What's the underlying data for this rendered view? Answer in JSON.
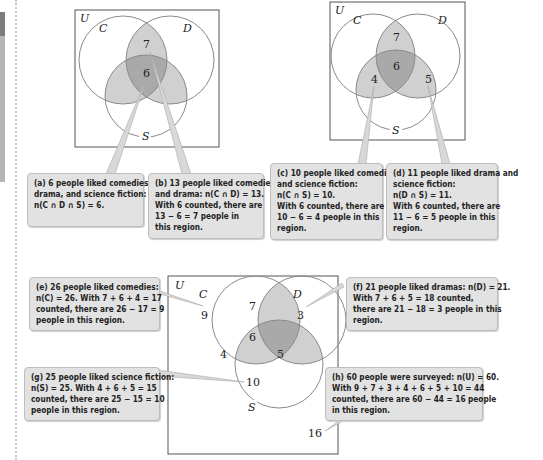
{
  "colors": {
    "light_region": "#d0d0d0",
    "dark_region": "#a9a9a9",
    "circle_stroke": "#8a8a8a",
    "callout_bg": "#e2e2e2"
  },
  "diagrams": [
    {
      "id": "top-left",
      "labels": {
        "universe": "U",
        "c": "C",
        "d": "D",
        "s": "S"
      },
      "regions": {
        "cd_only": "7",
        "cds": "6"
      }
    },
    {
      "id": "top-right",
      "labels": {
        "universe": "U",
        "c": "C",
        "d": "D",
        "s": "S"
      },
      "regions": {
        "cd_only": "7",
        "cds": "6",
        "cs_only": "4",
        "ds_only": "5"
      }
    },
    {
      "id": "bottom",
      "labels": {
        "universe": "U",
        "c": "C",
        "d": "D",
        "s": "S"
      },
      "regions": {
        "c_only": "9",
        "d_only": "3",
        "cd_only": "7",
        "cds": "6",
        "cs_only": "4",
        "ds_only": "5",
        "s_only": "10",
        "outside": "16"
      }
    }
  ],
  "callouts": {
    "a": [
      "(a) 6 people liked comedies,",
      "drama, and science fiction:",
      "n(C ∩ D ∩ S) = 6."
    ],
    "b": [
      "(b) 13 people liked comedies",
      "and drama: n(C ∩ D) = 13.",
      "With 6 counted, there are",
      "13 − 6 = 7 people in",
      "this region."
    ],
    "c": [
      "(c) 10 people liked comedies",
      "and science fiction:",
      "n(C ∩ S) = 10.",
      "With 6 counted, there are",
      "10 − 6 = 4 people in this",
      "region."
    ],
    "d": [
      "(d) 11 people liked drama and",
      "science fiction:",
      "n(D ∩ S) = 11.",
      "With 6 counted, there are",
      "11 − 6 = 5 people in this",
      "region."
    ],
    "e": [
      "(e) 26 people liked comedies:",
      "n(C) = 26. With 7 + 6 + 4 = 17",
      "counted, there are 26 − 17 = 9",
      "people in this region."
    ],
    "f": [
      "(f) 21 people liked dramas: n(D) = 21.",
      "With 7 + 6 + 5 = 18 counted,",
      "there are 21 − 18 = 3 people in this",
      "region."
    ],
    "g": [
      "(g) 25 people liked science fiction:",
      "n(S) = 25. With 4 + 6 + 5 = 15",
      "counted, there are 25 − 15 = 10",
      "people in this region."
    ],
    "h": [
      "(h) 60 people were surveyed: n(U) = 60.",
      "With 9 + 7 + 3 + 4 + 6 + 5 + 10 = 44",
      "counted, there are 60 − 44 = 16 people",
      "in this region."
    ]
  }
}
